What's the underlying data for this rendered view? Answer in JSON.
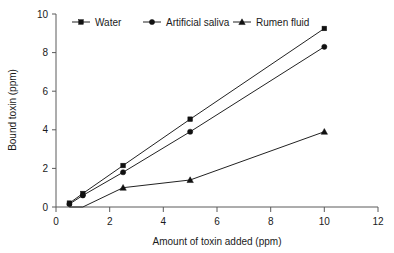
{
  "chart_data": {
    "type": "line",
    "title": "",
    "xlabel": "Amount of toxin added (ppm)",
    "ylabel": "Bound toxin (ppm)",
    "xlim": [
      0,
      12
    ],
    "ylim": [
      0,
      10
    ],
    "xticks": [
      "0",
      "2",
      "4",
      "6",
      "8",
      "10",
      "12"
    ],
    "yticks": [
      "0",
      "2",
      "4",
      "6",
      "8",
      "10"
    ],
    "xtick_values": [
      0,
      2,
      4,
      6,
      8,
      10,
      12
    ],
    "ytick_values": [
      0,
      2,
      4,
      6,
      8,
      10
    ],
    "grid": false,
    "legend_position": "top",
    "x": [
      0.5,
      1,
      2.5,
      5,
      10
    ],
    "series": [
      {
        "name": "Water",
        "marker": "square",
        "values": [
          0.2,
          0.7,
          2.15,
          4.55,
          9.25
        ]
      },
      {
        "name": "Artificial saliva",
        "marker": "circle",
        "values": [
          0.15,
          0.6,
          1.8,
          3.9,
          8.3
        ]
      },
      {
        "name": "Rumen fluid",
        "marker": "triangle",
        "values": [
          0.0,
          0.0,
          1.0,
          1.4,
          3.9
        ]
      }
    ]
  },
  "legend": {
    "items": [
      {
        "label": "Water",
        "marker": "square"
      },
      {
        "label": "Artificial saliva",
        "marker": "circle"
      },
      {
        "label": "Rumen fluid",
        "marker": "triangle"
      }
    ]
  },
  "axes": {
    "x_title": "Amount of toxin added (ppm)",
    "y_title": "Bound toxin (ppm)"
  }
}
